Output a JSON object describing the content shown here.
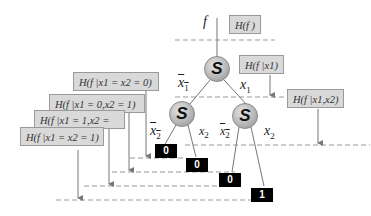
{
  "diagram": {
    "root_label": "f",
    "nodes": [
      {
        "id": "root",
        "label": "S"
      },
      {
        "id": "left",
        "label": "S"
      },
      {
        "id": "right",
        "label": "S"
      }
    ],
    "edge_labels": {
      "root_left": "x̄1",
      "root_right": "x1",
      "left_left": "x̄2",
      "left_right": "x2",
      "right_left": "x̄2",
      "right_right": "x2"
    },
    "leaves": [
      "0",
      "0",
      "0",
      "1"
    ],
    "entropy_boxes": {
      "h_f": "H(f )",
      "h_f_x1": "H(f |x1)",
      "h_f_x1x2": "H(f |x1,x2)",
      "h_x1_x2_0": "H(f |x1 = x2 = 0)",
      "h_x1_0_x2_1": "H(f |x1 = 0,x2 = 1)",
      "h_x1_1_x2": "H(f |x1 = 1,x2 =",
      "h_x1_x2_1": "H(f |x1 = x2 = 1)"
    },
    "colors": {
      "box_fill": "#d9d9d9",
      "box_border": "#9a9a9a",
      "leaf_fill": "#000000",
      "line": "#777777",
      "dashed": "#999999"
    }
  }
}
